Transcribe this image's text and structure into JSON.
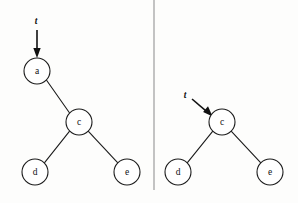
{
  "figure": {
    "background_color": "#fdfdfc",
    "ink_color": "#1b1b1b",
    "divider_color": "#9d9d9d",
    "width": 298,
    "height": 203
  },
  "divider": {
    "orientation": "vertical",
    "x": 154,
    "y1": 0,
    "y2": 190
  },
  "panels": [
    {
      "id": "left-panel",
      "name": "before-deletion",
      "pointer": {
        "label": "t",
        "label_x": 36,
        "label_y": 22,
        "direction": "down",
        "from_x": 37,
        "from_y": 30,
        "to_x": 37,
        "to_y": 57
      },
      "nodes": [
        {
          "id": "a",
          "label": "a",
          "cx": 37,
          "cy": 71,
          "r": 13
        },
        {
          "id": "c",
          "label": "c",
          "cx": 79,
          "cy": 122,
          "r": 13
        },
        {
          "id": "d",
          "label": "d",
          "cx": 35,
          "cy": 172,
          "r": 13
        },
        {
          "id": "e",
          "label": "e",
          "cx": 127,
          "cy": 172,
          "r": 13
        }
      ],
      "edges": [
        {
          "from": "a",
          "to": "c",
          "relation": "right-child"
        },
        {
          "from": "c",
          "to": "d",
          "relation": "left-child"
        },
        {
          "from": "c",
          "to": "e",
          "relation": "right-child"
        }
      ]
    },
    {
      "id": "right-panel",
      "name": "after-deletion",
      "pointer": {
        "label": "t",
        "label_x": 185,
        "label_y": 96,
        "direction": "down-right",
        "from_x": 192,
        "from_y": 99,
        "to_x": 212,
        "to_y": 116
      },
      "nodes": [
        {
          "id": "c",
          "label": "c",
          "cx": 222,
          "cy": 122,
          "r": 13
        },
        {
          "id": "d",
          "label": "d",
          "cx": 178,
          "cy": 172,
          "r": 13
        },
        {
          "id": "e",
          "label": "e",
          "cx": 270,
          "cy": 172,
          "r": 13
        }
      ],
      "edges": [
        {
          "from": "c",
          "to": "d",
          "relation": "left-child"
        },
        {
          "from": "c",
          "to": "e",
          "relation": "right-child"
        }
      ]
    }
  ]
}
